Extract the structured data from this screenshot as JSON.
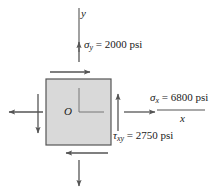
{
  "figure": {
    "element": {
      "fill_color": "#d9d9d9",
      "stroke_color": "#555555",
      "origin_label": "O"
    },
    "axes": {
      "x_label": "x",
      "y_label": "y"
    },
    "labels": {
      "sigma_y": {
        "symbol": "σ",
        "subscript": "y",
        "equals": "=",
        "value": "2000",
        "unit": "psi",
        "full": "σy = 2000 psi"
      },
      "sigma_x": {
        "symbol": "σ",
        "subscript": "x",
        "equals": "=",
        "value": "6800",
        "unit": "psi",
        "full": "σx = 6800 psi"
      },
      "tau_xy": {
        "symbol": "τ",
        "subscript": "xy",
        "equals": "=",
        "value": "2750",
        "unit": "psi",
        "full": "τxy = 2750 psi"
      }
    },
    "arrows": {
      "normal_stress_color": "#555555",
      "shear_stress_color": "#555555",
      "top_shear_direction": "right",
      "bottom_shear_direction": "left",
      "left_shear_direction": "down",
      "right_shear_direction": "up",
      "left_normal_direction": "left",
      "right_normal_direction": "right",
      "top_normal_direction": "up",
      "bottom_normal_direction": "down"
    }
  }
}
